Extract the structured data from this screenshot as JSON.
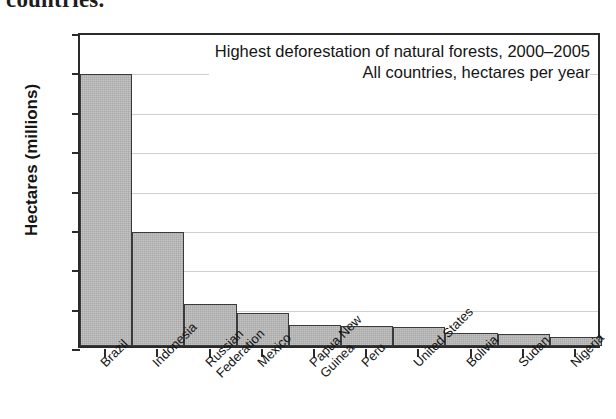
{
  "page": {
    "clipped_text_above_figure": "countries."
  },
  "chart_data": {
    "type": "bar",
    "title": "Highest deforestation of natural forests, 2000–2005",
    "subtitle": "All countries, hectares per year",
    "xlabel": "",
    "ylabel": "Hectares (millions)",
    "ylim": [
      0,
      4.0
    ],
    "yticks": [
      "0",
      "0.5",
      "1.0",
      "1.5",
      "2.0",
      "2.5",
      "3.0",
      "3.5",
      "4.0"
    ],
    "ytick_values": [
      0,
      0.5,
      1.0,
      1.5,
      2.0,
      2.5,
      3.0,
      3.5,
      4.0
    ],
    "grid": "horizontal",
    "legend": "none",
    "bar_color": "#a9a9a9",
    "bar_edge_color": "#3a3a3a",
    "axis_color": "#2b2b2b",
    "grid_color": "#cfcfcf",
    "categories": [
      "Brazil",
      "Indonesia",
      "Russian\nFederation",
      "Mexico",
      "Papua New\nGuinea",
      "Peru",
      "United States",
      "Bolivia",
      "Sudan",
      "Nigeria"
    ],
    "values": [
      3.46,
      1.45,
      0.53,
      0.42,
      0.27,
      0.25,
      0.24,
      0.16,
      0.15,
      0.12
    ]
  }
}
